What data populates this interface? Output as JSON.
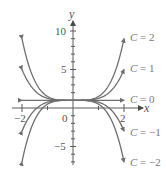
{
  "chart_data": {
    "type": "line",
    "title": "",
    "xlabel": "x",
    "ylabel": "y",
    "xlim": [
      -2.2,
      2.4
    ],
    "ylim": [
      -8,
      12
    ],
    "xticks": [
      -2,
      0,
      2
    ],
    "xtick_labels": [
      "−2",
      "0",
      "2"
    ],
    "yticks": [
      -5,
      0,
      5,
      10
    ],
    "ytick_labels": [
      "−5",
      "0",
      "5",
      "10"
    ],
    "grid": false,
    "legend_position": "inline-right",
    "function_form": "y = 1 + C·x⁴/4",
    "x": [
      -2,
      -1.5,
      -1,
      -0.5,
      0,
      0.5,
      1,
      1.5,
      2
    ],
    "series": [
      {
        "name": "C = 2",
        "C": 2,
        "values": [
          9,
          3.53,
          1.5,
          1.03,
          1,
          1.03,
          1.5,
          3.53,
          9
        ]
      },
      {
        "name": "C = 1",
        "C": 1,
        "values": [
          5,
          2.27,
          1.25,
          1.02,
          1,
          1.02,
          1.25,
          2.27,
          5
        ]
      },
      {
        "name": "C = 0",
        "C": 0,
        "values": [
          1,
          1,
          1,
          1,
          1,
          1,
          1,
          1,
          1
        ]
      },
      {
        "name": "C = −1",
        "C": -1,
        "values": [
          -3,
          -0.27,
          0.75,
          0.98,
          1,
          0.98,
          0.75,
          -0.27,
          -3
        ]
      },
      {
        "name": "C = −2",
        "C": -2,
        "values": [
          -7,
          -1.53,
          0.5,
          0.97,
          1,
          0.97,
          0.5,
          -1.53,
          -7
        ]
      }
    ],
    "colors": {
      "curves": "#6e6e6e",
      "axes": "#5a5a5a",
      "text": "#666666"
    }
  },
  "labels": {
    "x_axis": "x",
    "y_axis": "y",
    "y10": "10",
    "y5": "5",
    "y0": "0",
    "yneg5": "−5",
    "xneg2": "−2",
    "x2": "2",
    "curve_labels": [
      {
        "prefix": "C",
        "text": " = 2"
      },
      {
        "prefix": "C",
        "text": " = 1"
      },
      {
        "prefix": "C",
        "text": " = 0"
      },
      {
        "prefix": "C",
        "text": " = −1"
      },
      {
        "prefix": "C",
        "text": " = −2"
      }
    ]
  }
}
